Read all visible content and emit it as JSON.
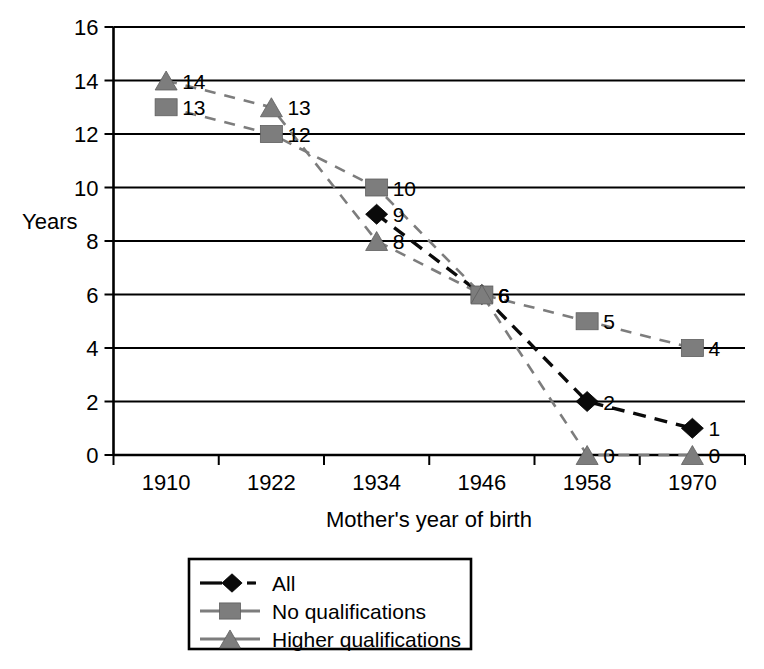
{
  "chart_data": {
    "type": "line",
    "title": "",
    "xlabel": "Mother's year of birth",
    "ylabel": "Years",
    "categories": [
      "1910",
      "1922",
      "1934",
      "1946",
      "1958",
      "1970"
    ],
    "yticks": [
      "0",
      "2",
      "4",
      "6",
      "8",
      "10",
      "12",
      "14",
      "16"
    ],
    "ylim": [
      0,
      16
    ],
    "grid": "horizontal",
    "legend_position": "bottom-center",
    "series": [
      {
        "name": "All",
        "marker": "diamond",
        "color": "#0a0a0a",
        "linestyle": "dashed",
        "x": [
          "1934",
          "1946",
          "1958",
          "1970"
        ],
        "values": [
          9,
          6,
          2,
          1
        ],
        "labels": [
          "9",
          "6",
          "2",
          "1"
        ]
      },
      {
        "name": "No qualifications",
        "marker": "square",
        "color": "#7d7d7d",
        "linestyle": "dashed",
        "x": [
          "1910",
          "1922",
          "1934",
          "1946",
          "1958",
          "1970"
        ],
        "values": [
          13,
          12,
          10,
          6,
          5,
          4
        ],
        "labels": [
          "13",
          "12",
          "10",
          "6",
          "5",
          "4"
        ]
      },
      {
        "name": "Higher qualifications",
        "marker": "triangle",
        "color": "#7d7d7d",
        "linestyle": "dashed",
        "x": [
          "1910",
          "1922",
          "1934",
          "1946",
          "1958",
          "1970"
        ],
        "values": [
          14,
          13,
          8,
          6,
          0,
          0
        ],
        "labels": [
          "14",
          "13",
          "8",
          "6",
          "0",
          "0"
        ]
      }
    ]
  },
  "legend": {
    "entries": [
      {
        "label": "All",
        "marker": "diamond-icon"
      },
      {
        "label": "No qualifications",
        "marker": "square-icon"
      },
      {
        "label": "Higher qualifications",
        "marker": "triangle-icon"
      }
    ]
  },
  "colors": {
    "gray_marker": "#7d7d7d",
    "black_marker": "#0a0a0a",
    "axis": "#000000",
    "background": "#ffffff"
  }
}
